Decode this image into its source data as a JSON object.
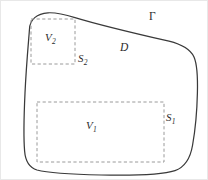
{
  "figure": {
    "name": "domain-subregions-diagram",
    "background_color": "#ffffff",
    "boundary_color": "#3a3a3a",
    "dashed_color": "#9a9a9a",
    "text_color": "#2b2b2b",
    "labels": {
      "outer_boundary": "Γ",
      "domain": "D",
      "volume_1": "V",
      "volume_1_sub": "1",
      "volume_2": "V",
      "volume_2_sub": "2",
      "surface_1": "S",
      "surface_1_sub": "1",
      "surface_2": "S",
      "surface_2_sub": "2"
    },
    "regions": [
      {
        "id": "v2-box",
        "label": "V2",
        "x": 30,
        "y": 18,
        "width": 44,
        "height": 45,
        "style": "dashed"
      },
      {
        "id": "v1-box",
        "label": "V1",
        "x": 36,
        "y": 101,
        "width": 127,
        "height": 60,
        "style": "dashed"
      }
    ],
    "outer_path": "M 28.5 28 C 28.8 18.5 36 12.5 47 11.8 C 56 11.3 64 13.5 74 16.6 C 100 24.5 140 33.8 168 40.2 C 180 43.2 189 47.5 193 56 C 196.5 64 196.8 76 196.4 92 C 196.0 110 194.6 127 191.6 144 C 189.6 156 184.4 166 174 169.6 C 160 174.2 130 174.6 100 174.0 C 72 173.4 48 172.2 36 169.0 C 28 166.6 24.4 160 23.6 150 C 22.6 138 22.8 118 24.0 92 C 25.2 66 27.4 42 28.5 28 Z"
  }
}
